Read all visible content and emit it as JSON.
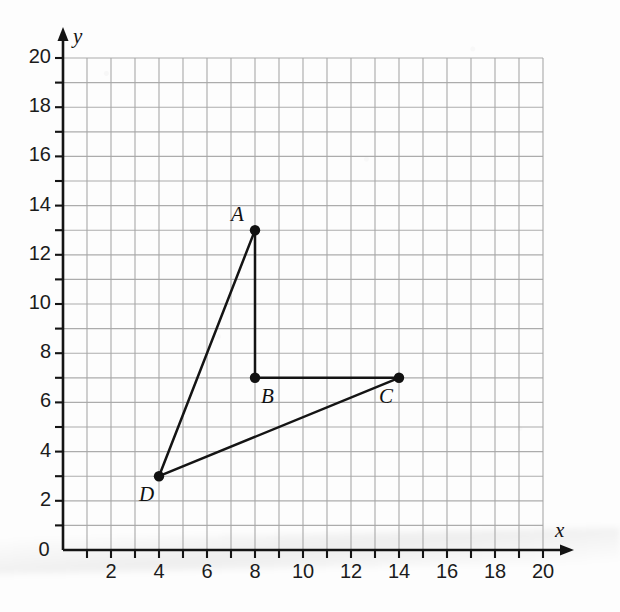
{
  "chart_data": {
    "type": "scatter",
    "title": "",
    "xlabel": "x",
    "ylabel": "y",
    "xlim": [
      0,
      20
    ],
    "ylim": [
      0,
      20
    ],
    "grid": true,
    "grid_step": 1,
    "tick_step": 1,
    "legend": "none",
    "x_tick_labels": [
      "0",
      "2",
      "4",
      "6",
      "8",
      "10",
      "12",
      "14",
      "16",
      "18",
      "20"
    ],
    "x_tick_values": [
      0,
      2,
      4,
      6,
      8,
      10,
      12,
      14,
      16,
      18,
      20
    ],
    "y_tick_labels": [
      "0",
      "2",
      "4",
      "6",
      "8",
      "10",
      "12",
      "14",
      "16",
      "18",
      "20"
    ],
    "y_tick_values": [
      0,
      2,
      4,
      6,
      8,
      10,
      12,
      14,
      16,
      18,
      20
    ],
    "points": [
      {
        "label": "A",
        "x": 8,
        "y": 13,
        "label_pos": "above-left"
      },
      {
        "label": "B",
        "x": 8,
        "y": 7,
        "label_pos": "below-right"
      },
      {
        "label": "C",
        "x": 14,
        "y": 7,
        "label_pos": "below-left"
      },
      {
        "label": "D",
        "x": 4,
        "y": 3,
        "label_pos": "below-left"
      }
    ],
    "segments": [
      {
        "from": "D",
        "to": "A"
      },
      {
        "from": "A",
        "to": "B"
      },
      {
        "from": "B",
        "to": "C"
      },
      {
        "from": "C",
        "to": "D"
      }
    ],
    "colors": {
      "grid": "#a6a6a6",
      "axis": "#141414",
      "point": "#111111",
      "segment": "#141414",
      "background": "#fdfdfd"
    }
  }
}
